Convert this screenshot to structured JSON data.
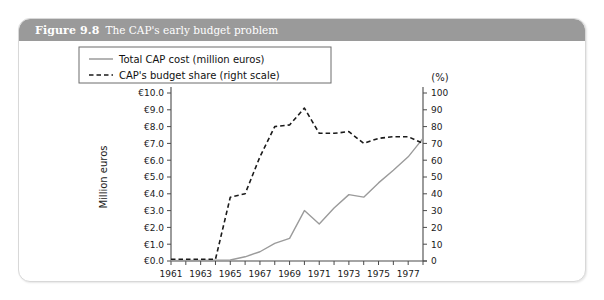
{
  "figure": {
    "number": "Figure 9.8",
    "caption": "The CAP's early budget problem"
  },
  "chart_data": {
    "type": "line",
    "title": "The CAP's early budget problem",
    "xlabel": "",
    "ylabel": "Million euros",
    "y2label": "(%)",
    "ylim": [
      0,
      10
    ],
    "y2lim": [
      0,
      100
    ],
    "xlim": [
      1961,
      1978
    ],
    "grid": false,
    "legend_position": "top-center",
    "x": [
      1961,
      1962,
      1963,
      1964,
      1965,
      1966,
      1967,
      1968,
      1969,
      1970,
      1971,
      1972,
      1973,
      1974,
      1975,
      1976,
      1977,
      1978
    ],
    "xticklabels": [
      "1961",
      "",
      "1963",
      "",
      "1965",
      "",
      "1967",
      "",
      "1969",
      "",
      "1971",
      "",
      "1973",
      "",
      "1975",
      "",
      "1977",
      ""
    ],
    "xtick_major": [
      "1961",
      "1963",
      "1965",
      "1967",
      "1969",
      "1971",
      "1973",
      "1975",
      "1977"
    ],
    "yticklabels": [
      "€0.0",
      "€1.0",
      "€2.0",
      "€3.0",
      "€4.0",
      "€5.0",
      "€6.0",
      "€7.0",
      "€8.0",
      "€9.0",
      "€10.0"
    ],
    "ytickvalues": [
      0,
      1,
      2,
      3,
      4,
      5,
      6,
      7,
      8,
      9,
      10
    ],
    "y2ticklabels": [
      "0",
      "10",
      "20",
      "30",
      "40",
      "50",
      "60",
      "70",
      "80",
      "90",
      "100"
    ],
    "y2tickvalues": [
      0,
      10,
      20,
      30,
      40,
      50,
      60,
      70,
      80,
      90,
      100
    ],
    "series": [
      {
        "name": "Total CAP cost (million euros)",
        "axis": "left",
        "style": "solid",
        "color": "#9b9b9b",
        "values": [
          0.02,
          0.03,
          0.04,
          0.05,
          0.06,
          0.25,
          0.55,
          1.05,
          1.35,
          3.0,
          2.2,
          3.15,
          3.95,
          3.8,
          4.65,
          5.4,
          6.2,
          7.3
        ]
      },
      {
        "name": "CAP's budget share (right scale)",
        "axis": "right",
        "style": "dashed",
        "color": "#1a1a1a",
        "values": [
          1,
          1,
          1,
          1,
          38,
          40,
          62,
          80,
          81,
          91,
          76,
          76,
          77,
          70,
          73,
          74,
          74,
          70
        ]
      }
    ]
  }
}
